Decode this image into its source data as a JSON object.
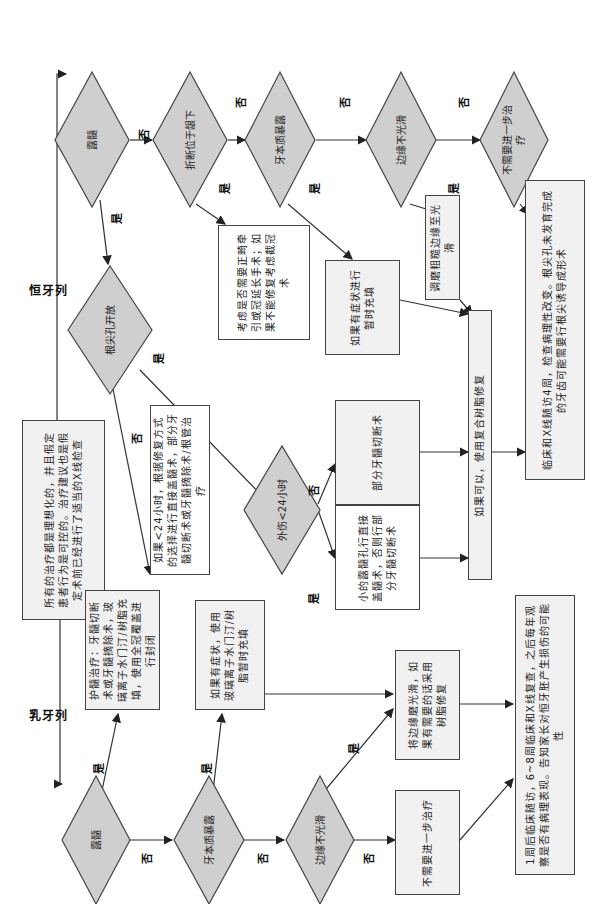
{
  "colors": {
    "diamond_fill": "#cfcfcf",
    "box_fill": "#f1f1f1",
    "line": "#333333"
  },
  "labels": {
    "yes": "是",
    "no": "否"
  },
  "permanent": {
    "title": "恒牙列",
    "d_pulp_exposure": "露髓",
    "d_subgingival": "折断位于龈下",
    "d_dentin": "牙本质暴露",
    "d_rough_edge": "边缘不光滑",
    "d_no_treatment": "不需要进一步治疗",
    "d_apex_open": "根尖孔开放",
    "d_trauma_24h": "外伤<24小时",
    "b_subgingival": "考虑是否需要正畸牵引或冠延长手术；如果不能修复考虑截冠术",
    "b_dentin": "如果有症状进行暂时充填",
    "b_rough": "调磨粗糙边缘至光滑",
    "b_followup": "临床和X线随访4周，检查病理性改变。根尖孔未发育完成的牙齿可能需要行根尖诱导成形术",
    "b_composite": "如果可以，使用复合树脂修复",
    "b_partial_pulpotomy": "部分牙髓切断术",
    "b_small_exposure": "小的露髓孔行直接盖髓术，否则行部分牙髓切断术",
    "b_apex_closed": "如果<24小时，根据修复方式的选择进行直接盖髓术，部分牙髓切断术或牙髓摘除术/根管治疗"
  },
  "note": "所有的治疗都是理想化的，并且假定患者行为是可控的。治疗建议也是假定术前已经进行了适当的X线检查",
  "primary": {
    "title": "乳牙列",
    "d_pulp_exposure": "露髓",
    "d_dentin": "牙本质暴露",
    "d_rough_edge": "边缘不光滑",
    "b_pulp": "护髓治疗：牙髓切断术或牙髓摘除术，玻璃离子水门汀/树脂充填，使用全冠覆盖进行封闭",
    "b_dentin": "如果有症状，使用玻璃离子水门汀/树脂暂时充填",
    "b_smooth": "将边缘磨光滑，如果有需要的话采用树脂修复",
    "b_no_treatment": "不需要进一步治疗",
    "b_followup": "1周后临床随访，6~8周临床和X线复查，之后每年观察是否有病理表现。告知家长对恒牙胚产生损伤的可能性"
  }
}
